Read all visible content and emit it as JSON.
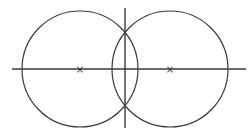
{
  "diagram": {
    "line_color": "#3a3a3a",
    "background": "#ffffff",
    "circles": [
      {
        "id": "left-circle",
        "center_label": "×"
      },
      {
        "id": "right-circle",
        "center_label": "×"
      }
    ],
    "center_marker_glyph": "×"
  }
}
